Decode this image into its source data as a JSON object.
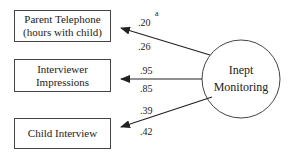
{
  "diagram": {
    "latent": {
      "line1": "Inept",
      "line2": "Monitoring"
    },
    "indicators": [
      {
        "line1": "Parent Telephone",
        "line2": "(hours with child)",
        "top_loading": ".20",
        "superscript": "a",
        "bottom_loading": ".26"
      },
      {
        "line1": "Interviewer",
        "line2": "Impressions",
        "top_loading": ".95",
        "bottom_loading": ".85"
      },
      {
        "line1": "Child Interview",
        "top_loading": ".39",
        "bottom_loading": ".42"
      }
    ]
  }
}
